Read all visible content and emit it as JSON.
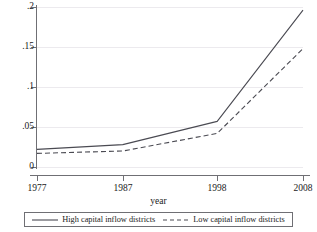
{
  "chart_data": {
    "type": "line",
    "title": "",
    "xlabel": "year",
    "ylabel": "",
    "x": [
      1977,
      1987,
      1998,
      2008
    ],
    "xtick_labels": [
      "1977",
      "1987",
      "1998",
      "2008"
    ],
    "ytick_labels": [
      "0",
      ".05",
      ".1",
      ".15",
      ".2"
    ],
    "ytick_values": [
      0,
      0.05,
      0.1,
      0.15,
      0.2
    ],
    "xlim": [
      1977,
      2008
    ],
    "ylim": [
      0,
      0.2
    ],
    "grid": "horizontal",
    "legend_position": "bottom",
    "series": [
      {
        "name": "High capital inflow districts",
        "style": "solid",
        "color": "#4a4a52",
        "values": [
          0.022,
          0.028,
          0.057,
          0.196
        ]
      },
      {
        "name": "Low capital inflow districts",
        "style": "dashed",
        "color": "#4a4a52",
        "values": [
          0.017,
          0.02,
          0.042,
          0.148
        ]
      }
    ]
  },
  "figure": {
    "cropped_title": "· ·",
    "axis_color": "#6f6f74",
    "grid_color": "#eceaee",
    "background": "#ffffff"
  },
  "legend": {
    "entries": [
      {
        "label": "High capital inflow districts",
        "style": "solid"
      },
      {
        "label": "Low capital inflow districts",
        "style": "dashed"
      }
    ]
  }
}
